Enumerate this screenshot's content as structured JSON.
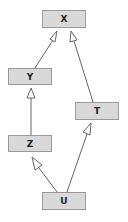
{
  "diagram": {
    "type": "class-hierarchy",
    "nodes": [
      {
        "id": "X",
        "label": "X",
        "x": 42,
        "y": 10,
        "w": 44,
        "h": 18
      },
      {
        "id": "Y",
        "label": "Y",
        "x": 8,
        "y": 68,
        "w": 44,
        "h": 17
      },
      {
        "id": "T",
        "label": "T",
        "x": 75,
        "y": 102,
        "w": 44,
        "h": 18
      },
      {
        "id": "Z",
        "label": "Z",
        "x": 8,
        "y": 135,
        "w": 44,
        "h": 17
      },
      {
        "id": "U",
        "label": "U",
        "x": 42,
        "y": 192,
        "w": 44,
        "h": 18
      }
    ],
    "edges": [
      {
        "from": "Y",
        "to": "X",
        "arrow": "hollow-triangle"
      },
      {
        "from": "T",
        "to": "X",
        "arrow": "hollow-triangle"
      },
      {
        "from": "Z",
        "to": "Y",
        "arrow": "hollow-triangle"
      },
      {
        "from": "U",
        "to": "Z",
        "arrow": "hollow-triangle"
      },
      {
        "from": "U",
        "to": "T",
        "arrow": "hollow-triangle"
      }
    ],
    "colors": {
      "node_fill": "#d9d9d9",
      "node_border": "#9a9a9a",
      "edge": "#666666"
    }
  }
}
